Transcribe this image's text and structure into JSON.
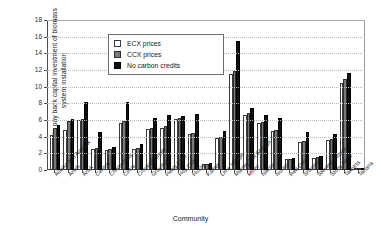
{
  "chart_data": {
    "type": "bar",
    "title": "",
    "xlabel": "Community",
    "ylabel": "Years to pay back capital investment of biomass system installation",
    "ylim": [
      0,
      18
    ],
    "ytick_step": 2,
    "yticks": [
      "0",
      "2",
      "4",
      "6",
      "8",
      "10",
      "12",
      "14",
      "16",
      "18"
    ],
    "grid": true,
    "legend_position": "upper-left-inside",
    "categories": [
      "Alaska and Alaskak",
      "Anvik",
      "Anuk",
      "Central",
      "Chistochina",
      "Circle",
      "Crooked Creek",
      "Grayling",
      "Healy Lake",
      "Hoy Cross",
      "Huslia",
      "Kaltag",
      "Lime Village",
      "Manley Hot Springs",
      "Minto",
      "Nikolai",
      "Nulato",
      "Red Devil",
      "Shageluk",
      "Stevens Village",
      "Stony River",
      "Takotna",
      "Tanana"
    ],
    "series": [
      {
        "name": "ECX prices",
        "color": "#ffffff",
        "values": [
          4.2,
          4.8,
          6.0,
          2.5,
          2.4,
          5.7,
          2.5,
          4.9,
          5.1,
          6.1,
          4.3,
          0.7,
          3.9,
          11.5,
          6.6,
          5.6,
          4.7,
          1.3,
          3.4,
          1.5,
          3.6,
          10.5,
          0
        ]
      },
      {
        "name": "CCX prices",
        "color": "#7a7a7a",
        "values": [
          5.0,
          5.9,
          6.1,
          2.6,
          2.5,
          5.9,
          2.6,
          5.1,
          5.3,
          6.3,
          4.4,
          0.75,
          4.0,
          11.9,
          6.8,
          5.8,
          4.8,
          1.35,
          3.5,
          1.55,
          3.7,
          10.9,
          0
        ]
      },
      {
        "name": "No carbon credits",
        "color": "#111111",
        "values": [
          5.4,
          6.1,
          8.2,
          4.6,
          2.8,
          8.2,
          3.1,
          6.3,
          6.6,
          6.5,
          6.7,
          0.8,
          4.7,
          15.5,
          7.5,
          6.6,
          6.3,
          1.5,
          4.6,
          1.7,
          4.3,
          11.6,
          0
        ]
      }
    ]
  },
  "legend": {
    "items": [
      {
        "label": "ECX prices",
        "key": "ecx"
      },
      {
        "label": "CCX prices",
        "key": "ccx"
      },
      {
        "label": "No carbon credits",
        "key": "nocc"
      }
    ]
  }
}
